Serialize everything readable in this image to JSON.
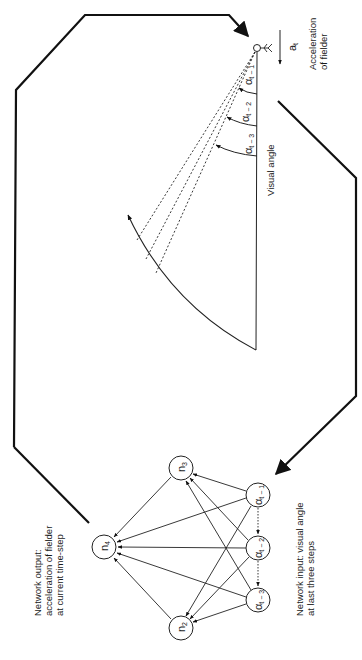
{
  "diagram": {
    "fielder_panel": {
      "acceleration_symbol": "a",
      "acceleration_subscript": "t",
      "acceleration_label_line1": "Acceleration",
      "acceleration_label_line2": "of fielder",
      "visual_angle_label": "Visual angle",
      "angles": [
        {
          "symbol": "α",
          "subscript": "t − 1"
        },
        {
          "symbol": "α",
          "subscript": "t − 2"
        },
        {
          "symbol": "α",
          "subscript": "t − 3"
        }
      ]
    },
    "network_panel": {
      "output_label_line1": "Network output:",
      "output_label_line2": "acceleration of fielder",
      "output_label_line3": "at current time-step",
      "input_label_line1": "Network input: visual angle",
      "input_label_line2": "at last three steps",
      "nodes": [
        {
          "id": "n4",
          "symbol": "n",
          "subscript": "4"
        },
        {
          "id": "n3",
          "symbol": "n",
          "subscript": "3"
        },
        {
          "id": "n2",
          "symbol": "n",
          "subscript": "2"
        },
        {
          "id": "a1",
          "symbol": "α",
          "subscript": "t − 1"
        },
        {
          "id": "a2",
          "symbol": "α",
          "subscript": "t − 2"
        },
        {
          "id": "a3",
          "symbol": "α",
          "subscript": "t − 3"
        }
      ]
    },
    "colors": {
      "stroke": "#111111",
      "background": "#ffffff"
    }
  }
}
